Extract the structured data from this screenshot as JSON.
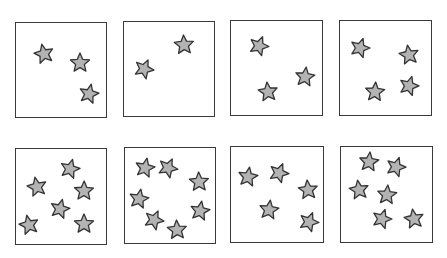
{
  "figure": {
    "star_fill": "#b3b3b3",
    "star_stroke": "#333333",
    "box_stroke": "#3a3a3a",
    "panels": [
      {
        "row": 0,
        "col": 0,
        "x": 15,
        "y": 22,
        "w": 92,
        "h": 96,
        "star_count": 3,
        "stars": [
          [
            44,
            54
          ],
          [
            80,
            63
          ],
          [
            89,
            94
          ]
        ]
      },
      {
        "row": 0,
        "col": 1,
        "x": 123,
        "y": 21,
        "w": 92,
        "h": 96,
        "star_count": 2,
        "stars": [
          [
            144,
            69
          ],
          [
            184,
            45
          ]
        ]
      },
      {
        "row": 0,
        "col": 2,
        "x": 230,
        "y": 20,
        "w": 93,
        "h": 96,
        "star_count": 3,
        "stars": [
          [
            259,
            46
          ],
          [
            268,
            92
          ],
          [
            305,
            77
          ]
        ]
      },
      {
        "row": 0,
        "col": 3,
        "x": 339,
        "y": 20,
        "w": 93,
        "h": 96,
        "star_count": 4,
        "stars": [
          [
            360,
            48
          ],
          [
            409,
            55
          ],
          [
            375,
            92
          ],
          [
            409,
            86
          ]
        ]
      },
      {
        "row": 1,
        "col": 0,
        "x": 15,
        "y": 148,
        "w": 92,
        "h": 97,
        "star_count": 6,
        "stars": [
          [
            70,
            169
          ],
          [
            37,
            187
          ],
          [
            84,
            191
          ],
          [
            60,
            209
          ],
          [
            29,
            225
          ],
          [
            84,
            224
          ]
        ]
      },
      {
        "row": 1,
        "col": 1,
        "x": 124,
        "y": 147,
        "w": 92,
        "h": 97,
        "star_count": 7,
        "stars": [
          [
            145,
            168
          ],
          [
            168,
            168
          ],
          [
            199,
            182
          ],
          [
            139,
            199
          ],
          [
            154,
            220
          ],
          [
            177,
            230
          ],
          [
            200,
            211
          ]
        ]
      },
      {
        "row": 1,
        "col": 2,
        "x": 230,
        "y": 146,
        "w": 94,
        "h": 97,
        "star_count": 5,
        "stars": [
          [
            248,
            177
          ],
          [
            279,
            173
          ],
          [
            308,
            190
          ],
          [
            269,
            210
          ],
          [
            309,
            222
          ]
        ]
      },
      {
        "row": 1,
        "col": 3,
        "x": 340,
        "y": 146,
        "w": 93,
        "h": 97,
        "star_count": 6,
        "stars": [
          [
            369,
            162
          ],
          [
            396,
            167
          ],
          [
            359,
            190
          ],
          [
            387,
            195
          ],
          [
            382,
            219
          ],
          [
            414,
            219
          ]
        ]
      }
    ]
  }
}
